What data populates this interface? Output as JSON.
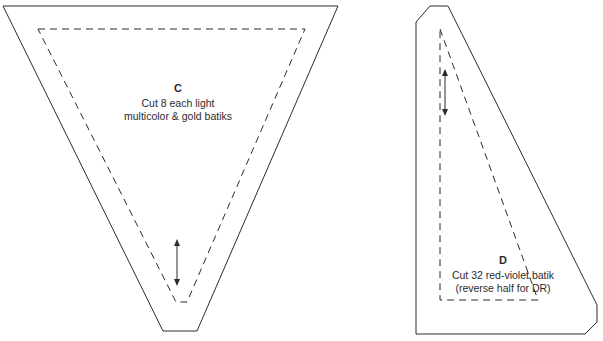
{
  "document": {
    "title": "Quilt Pattern Templates",
    "background_color": "#ffffff",
    "line_color": "#2b2b2b",
    "text_color": "#2b2b2b"
  },
  "pieces": [
    {
      "id": "piece-c",
      "letter": "C",
      "note_line_1": "Cut 8 each light",
      "note_line_2": "multicolor & gold batiks",
      "shape": "inverted-triangle-truncated-tip",
      "cut_outline_points": "3,6 338,6 197,331 163,331",
      "seam_line_points": "38,29 305,29 187,302 176,302",
      "grainline": {
        "x": 177,
        "y_top": 240,
        "y_bottom": 285,
        "double_headed": true
      }
    },
    {
      "id": "piece-d",
      "letter": "D",
      "note_line_1": "Cut 32 red-violet batik",
      "note_line_2": "(reverse half for DR)",
      "shape": "right-triangle-chamfered",
      "cut_outline_points": "416,22 430,6 448,6 597,305 597,322 585,334 416,334",
      "seam_line_points": "440,29 538,300 440,300",
      "grainline": {
        "x": 445,
        "y_top": 70,
        "y_bottom": 115,
        "double_headed": true
      }
    }
  ]
}
